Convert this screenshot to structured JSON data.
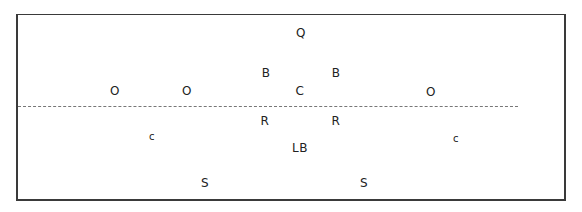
{
  "diagram": {
    "type": "football-formation",
    "line_of_scrimmage": "dashed",
    "colors": {
      "border": "#3a3a3a",
      "line": "#777777",
      "text": "#222222"
    },
    "players": [
      {
        "label": "Q",
        "x": 301,
        "y": 33,
        "size": "normal"
      },
      {
        "label": "B",
        "x": 266,
        "y": 73,
        "size": "normal"
      },
      {
        "label": "B",
        "x": 336,
        "y": 73,
        "size": "normal"
      },
      {
        "label": "O",
        "x": 115,
        "y": 91,
        "size": "normal"
      },
      {
        "label": "O",
        "x": 187,
        "y": 91,
        "size": "normal"
      },
      {
        "label": "C",
        "x": 300,
        "y": 91,
        "size": "normal"
      },
      {
        "label": "O",
        "x": 431,
        "y": 92,
        "size": "normal"
      },
      {
        "label": "R",
        "x": 265,
        "y": 121,
        "size": "normal"
      },
      {
        "label": "R",
        "x": 336,
        "y": 121,
        "size": "normal"
      },
      {
        "label": "c",
        "x": 152,
        "y": 137,
        "size": "small"
      },
      {
        "label": "c",
        "x": 456,
        "y": 139,
        "size": "small"
      },
      {
        "label": "LB",
        "x": 300,
        "y": 148,
        "size": "normal"
      },
      {
        "label": "S",
        "x": 205,
        "y": 183,
        "size": "normal"
      },
      {
        "label": "S",
        "x": 364,
        "y": 183,
        "size": "normal"
      }
    ]
  }
}
